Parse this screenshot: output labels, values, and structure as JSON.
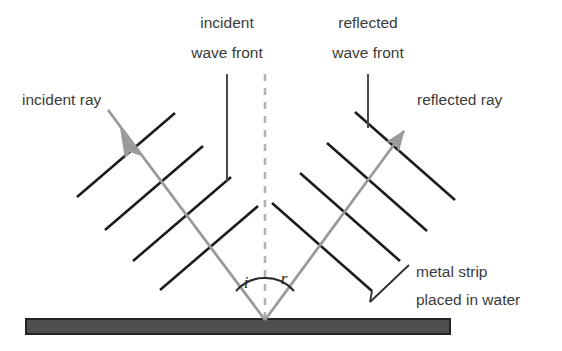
{
  "figure": {
    "background_color": "#ffffff",
    "width": 562,
    "height": 351
  },
  "colors": {
    "ray": "#9a9a9a",
    "wavefront": "#1c1c1c",
    "leader": "#3d3d3d",
    "normal_dash": "#b0b0b0",
    "strip_fill": "#4f4f4f",
    "strip_stroke": "#2a2a2a",
    "text": "#3b3b3b"
  },
  "labels": {
    "incident_ray": "incident ray",
    "reflected_ray": "reflected ray",
    "incident_wave_front_line1": "incident",
    "incident_wave_front_line2": "wave front",
    "reflected_wave_front_line1": "reflected",
    "reflected_wave_front_line2": "wave front",
    "metal_strip_line1": "metal strip",
    "metal_strip_line2": "placed in water",
    "angle_incidence": "i",
    "angle_reflection": "r"
  },
  "geometry": {
    "reflection_point": {
      "x": 265,
      "y": 320
    },
    "normal": {
      "x": 265,
      "y_top": 74,
      "y_bottom": 322,
      "dashed": true
    },
    "incident_ray": {
      "x1": 108,
      "y1": 110,
      "x2": 265,
      "y2": 320,
      "arrow_at": {
        "x": 133,
        "y": 143
      }
    },
    "reflected_ray": {
      "x1": 265,
      "y1": 320,
      "x2": 412,
      "y2": 120,
      "arrow_at": {
        "x": 412,
        "y": 120
      }
    },
    "incident_wavefronts": [
      {
        "x1": 77,
        "y1": 197,
        "x2": 175,
        "y2": 113
      },
      {
        "x1": 105,
        "y1": 230,
        "x2": 203,
        "y2": 146
      },
      {
        "x1": 133,
        "y1": 261,
        "x2": 231,
        "y2": 177
      },
      {
        "x1": 160,
        "y1": 290,
        "x2": 258,
        "y2": 206
      }
    ],
    "reflected_wavefronts": [
      {
        "x1": 355,
        "y1": 112,
        "x2": 455,
        "y2": 200
      },
      {
        "x1": 327,
        "y1": 143,
        "x2": 427,
        "y2": 231
      },
      {
        "x1": 300,
        "y1": 173,
        "x2": 400,
        "y2": 261
      },
      {
        "x1": 272,
        "y1": 203,
        "x2": 372,
        "y2": 291
      }
    ],
    "metal_strip": {
      "x": 26,
      "y": 319,
      "width": 424,
      "height": 15
    },
    "angle_arc_incidence": {
      "label_x": 248,
      "label_y": 285
    },
    "angle_arc_reflection": {
      "label_x": 282,
      "label_y": 282
    }
  },
  "leaders": {
    "incident_ray_leader": {
      "x1": 100,
      "y1": 108,
      "x2": 133,
      "y2": 146
    },
    "reflected_ray_leader": {
      "x1": 412,
      "y1": 120,
      "x2": 385,
      "y2": 148
    },
    "incident_wavefront_leader": {
      "x1": 227,
      "y1": 74,
      "x2": 227,
      "y2": 180
    },
    "reflected_wavefront_leader": {
      "x1": 368,
      "y1": 74,
      "x2": 368,
      "y2": 128
    },
    "metal_strip_leader": {
      "x1": 408,
      "y1": 266,
      "x2": 370,
      "y2": 302
    }
  },
  "physics": {
    "law": "angle of incidence equals angle of reflection",
    "angle_incidence_deg": 37,
    "angle_reflection_deg": 37
  }
}
